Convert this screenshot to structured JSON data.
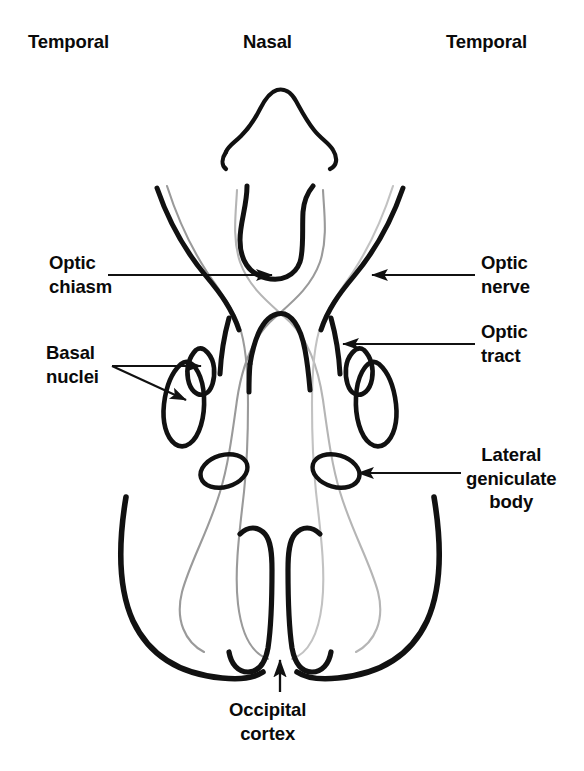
{
  "figure": {
    "background_color": "#ffffff",
    "outline_color": "#111111",
    "pathway_color": "#8e8e8e",
    "label_color": "#0a0a0a"
  },
  "orientation_labels": {
    "temporal_left": "Temporal",
    "nasal": "Nasal",
    "temporal_right": "Temporal"
  },
  "labels": {
    "optic_chiasm": "Optic\nchiasm",
    "basal_nuclei": "Basal\nnuclei",
    "optic_nerve": "Optic\nnerve",
    "optic_tract": "Optic\ntract",
    "lateral_geniculate_body": "Lateral\ngeniculate\nbody",
    "occipital_cortex": "Occipital\ncortex"
  },
  "structures": [
    {
      "name": "nose",
      "label": null,
      "side": "center"
    },
    {
      "name": "optic-nerve",
      "label": "Optic nerve",
      "side": "both"
    },
    {
      "name": "optic-chiasm",
      "label": "Optic chiasm",
      "side": "center"
    },
    {
      "name": "optic-tract",
      "label": "Optic tract",
      "side": "both"
    },
    {
      "name": "basal-nuclei",
      "label": "Basal nuclei",
      "side": "both"
    },
    {
      "name": "lateral-geniculate-body",
      "label": "Lateral geniculate body",
      "side": "both"
    },
    {
      "name": "occipital-cortex",
      "label": "Occipital cortex",
      "side": "center"
    }
  ],
  "leader_lines": [
    {
      "name": "optic-chiasm-leader",
      "direction": "right",
      "arrowheads": 1
    },
    {
      "name": "basal-nuclei-leader",
      "direction": "right",
      "arrowheads": 2
    },
    {
      "name": "optic-nerve-leader",
      "direction": "left",
      "arrowheads": 1
    },
    {
      "name": "optic-tract-leader",
      "direction": "left",
      "arrowheads": 1
    },
    {
      "name": "lgb-leader",
      "direction": "left",
      "arrowheads": 1
    },
    {
      "name": "occipital-cortex-leader",
      "direction": "up",
      "arrowheads": 1
    }
  ]
}
